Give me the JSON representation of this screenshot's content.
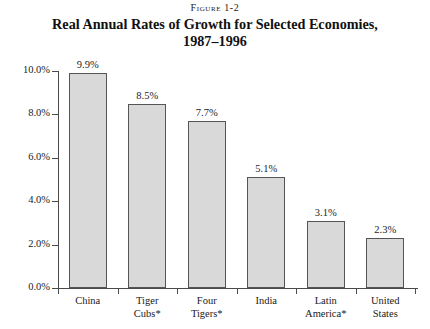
{
  "figure": {
    "label": "Figure 1-2",
    "title_line1": "Real Annual Rates of Growth for Selected Economies,",
    "title_line2": "1987–1996"
  },
  "chart_data": {
    "type": "bar",
    "title": "Real Annual Rates of Growth for Selected Economies, 1987–1996",
    "subtitle": "Figure 1-2",
    "xlabel": "",
    "ylabel": "",
    "ylim": [
      0,
      10
    ],
    "ytick_labels": [
      "0.0%",
      "2.0%",
      "4.0%",
      "6.0%",
      "8.0%",
      "10.0%"
    ],
    "ytick_values": [
      0,
      2,
      4,
      6,
      8,
      10
    ],
    "grid": false,
    "legend": "none",
    "categories": [
      "China",
      "Tiger Cubs*",
      "Four Tigers*",
      "India",
      "Latin America*",
      "United States"
    ],
    "category_lines": [
      [
        "China"
      ],
      [
        "Tiger",
        "Cubs*"
      ],
      [
        "Four",
        "Tigers*"
      ],
      [
        "India"
      ],
      [
        "Latin",
        "America*"
      ],
      [
        "United",
        "States"
      ]
    ],
    "values": [
      9.9,
      8.5,
      7.7,
      5.1,
      3.1,
      2.3
    ],
    "value_labels": [
      "9.9%",
      "8.5%",
      "7.7%",
      "5.1%",
      "3.1%",
      "2.3%"
    ],
    "bar_fill": "#d9d9d9",
    "bar_stroke": "#555555",
    "axis_color": "#4a4a4a"
  }
}
